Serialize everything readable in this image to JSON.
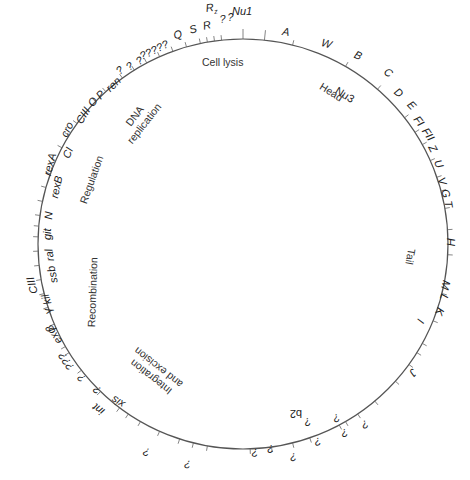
{
  "title": "",
  "circle": {
    "cx": 243,
    "cy": 244,
    "r": 205,
    "stroke": "#555555"
  },
  "ticks_deg": [
    -90,
    -84,
    -76,
    -60,
    -49,
    -38,
    -33,
    -29,
    -24,
    -19,
    -15,
    -10,
    -4,
    3,
    14,
    22,
    29,
    32,
    36,
    42,
    50,
    56,
    60,
    62,
    71,
    76,
    82,
    88,
    100,
    104,
    108,
    114,
    120,
    124,
    127,
    134,
    142,
    148,
    150,
    157,
    162,
    166,
    170,
    174,
    178,
    182,
    185,
    188,
    192,
    196,
    200,
    204,
    208,
    212,
    216,
    220,
    224,
    228,
    234,
    238,
    242,
    246,
    250,
    254,
    258,
    260,
    262,
    264
  ],
  "genes": [
    {
      "label": "Nu1",
      "x": 232,
      "y": 6,
      "rot": 0
    },
    {
      "label": "A",
      "x": 283,
      "y": 26,
      "rot": 8
    },
    {
      "label": "W",
      "x": 323,
      "y": 37,
      "rot": 16
    },
    {
      "label": "B",
      "x": 357,
      "y": 49,
      "rot": 24
    },
    {
      "label": "C",
      "x": 388,
      "y": 66,
      "rot": 34
    },
    {
      "label": "D",
      "x": 399,
      "y": 86,
      "rot": 40
    },
    {
      "label": "E",
      "x": 413,
      "y": 99,
      "rot": 46
    },
    {
      "label": "FI",
      "x": 420,
      "y": 114,
      "rot": 52
    },
    {
      "label": "FII",
      "x": 429,
      "y": 126,
      "rot": 56
    },
    {
      "label": "Z",
      "x": 436,
      "y": 143,
      "rot": 62
    },
    {
      "label": "U",
      "x": 442,
      "y": 158,
      "rot": 66
    },
    {
      "label": "V",
      "x": 446,
      "y": 176,
      "rot": 72
    },
    {
      "label": "G",
      "x": 450,
      "y": 188,
      "rot": 76
    },
    {
      "label": "T",
      "x": 453,
      "y": 200,
      "rot": 80
    },
    {
      "label": "H",
      "x": 456,
      "y": 238,
      "rot": 90
    },
    {
      "label": "M",
      "x": 452,
      "y": 282,
      "rot": 104
    },
    {
      "label": "L",
      "x": 450,
      "y": 296,
      "rot": 108
    },
    {
      "label": "K",
      "x": 446,
      "y": 310,
      "rot": 112
    },
    {
      "label": "I",
      "x": 426,
      "y": 322,
      "rot": 116
    },
    {
      "label": "J",
      "x": 419,
      "y": 374,
      "rot": 132
    },
    {
      "label": "?",
      "x": 370,
      "y": 428,
      "rot": 156
    },
    {
      "label": "?",
      "x": 349,
      "y": 437,
      "rot": 162
    },
    {
      "label": "?",
      "x": 341,
      "y": 422,
      "rot": 160
    },
    {
      "label": "?",
      "x": 322,
      "y": 446,
      "rot": 166
    },
    {
      "label": "?",
      "x": 312,
      "y": 426,
      "rot": 162
    },
    {
      "label": "?",
      "x": 297,
      "y": 462,
      "rot": 172
    },
    {
      "label": "?",
      "x": 274,
      "y": 454,
      "rot": 176
    },
    {
      "label": "?",
      "x": 258,
      "y": 458,
      "rot": 178
    },
    {
      "label": "?",
      "x": 190,
      "y": 470,
      "rot": 186
    },
    {
      "label": "?",
      "x": 148,
      "y": 458,
      "rot": 194
    },
    {
      "label": "xis",
      "x": 121,
      "y": 410,
      "rot": 212
    },
    {
      "label": "int",
      "x": 100,
      "y": 417,
      "rot": 216
    },
    {
      "label": "?",
      "x": 96,
      "y": 396,
      "rot": 220
    },
    {
      "label": "?",
      "x": 80,
      "y": 384,
      "rot": 224
    },
    {
      "label": "exo",
      "x": 55,
      "y": 346,
      "rot": 236
    },
    {
      "label": "???",
      "x": 67,
      "y": 372,
      "rot": 236
    },
    {
      "label": "β",
      "x": 47,
      "y": 334,
      "rot": 240
    },
    {
      "label": "γ",
      "x": 44,
      "y": 316,
      "rot": 246
    },
    {
      "label": "kil",
      "x": 43,
      "y": 306,
      "rot": 252
    },
    {
      "label": "CIII",
      "x": 29,
      "y": 295,
      "rot": 256
    },
    {
      "label": "ssb",
      "x": 49,
      "y": 284,
      "rot": 258
    },
    {
      "label": "ral",
      "x": 45,
      "y": 262,
      "rot": 262
    },
    {
      "label": "git",
      "x": 42,
      "y": 240,
      "rot": 270
    },
    {
      "label": "N",
      "x": 43,
      "y": 219,
      "rot": 274
    },
    {
      "label": "rexB",
      "x": 49,
      "y": 197,
      "rot": 282
    },
    {
      "label": "rexA",
      "x": 42,
      "y": 174,
      "rot": 284
    },
    {
      "label": "CI",
      "x": 61,
      "y": 156,
      "rot": 292
    },
    {
      "label": "cro",
      "x": 59,
      "y": 134,
      "rot": 296
    },
    {
      "label": "CIII",
      "x": 74,
      "y": 120,
      "rot": 302
    },
    {
      "label": "O",
      "x": 86,
      "y": 102,
      "rot": 308
    },
    {
      "label": "P",
      "x": 94,
      "y": 94,
      "rot": 312
    },
    {
      "label": "ren",
      "x": 104,
      "y": 86,
      "rot": 316
    },
    {
      "label": "?",
      "x": 114,
      "y": 68,
      "rot": 320
    },
    {
      "label": "?",
      "x": 124,
      "y": 64,
      "rot": 322
    },
    {
      "label": "?",
      "x": 134,
      "y": 58,
      "rot": 326
    },
    {
      "label": "?????",
      "x": 138,
      "y": 52,
      "rot": 334
    },
    {
      "label": "Q",
      "x": 172,
      "y": 31,
      "rot": 340
    },
    {
      "label": "S",
      "x": 188,
      "y": 25,
      "rot": 344
    },
    {
      "label": "R",
      "x": 202,
      "y": 21,
      "rot": 348
    },
    {
      "label": "Rz",
      "x": 205,
      "y": 3,
      "rot": 352
    },
    {
      "label": "?",
      "x": 219,
      "y": 14,
      "rot": 354
    },
    {
      "label": "?",
      "x": 227,
      "y": 12,
      "rot": 356
    }
  ],
  "inner_labels": [
    {
      "label": "Nu3",
      "x": 339,
      "y": 85,
      "rot": 32,
      "italic": false
    },
    {
      "label": "b2",
      "x": 302,
      "y": 419,
      "rot": 180,
      "italic": false
    }
  ],
  "regions": [
    {
      "name": "cell-lysis",
      "lines": [
        "Cell lysis"
      ],
      "x": 202,
      "y": 56,
      "rot": 0
    },
    {
      "name": "head",
      "lines": [
        "Head"
      ],
      "x": 324,
      "y": 80,
      "rot": 32
    },
    {
      "name": "tail",
      "lines": [
        "Tail"
      ],
      "x": 418,
      "y": 250,
      "rot": 100
    },
    {
      "name": "dna-replication",
      "lines": [
        "DNA",
        "replication"
      ],
      "x": 115,
      "y": 131,
      "rot": -52
    },
    {
      "name": "regulation",
      "lines": [
        "Regulation"
      ],
      "x": 77,
      "y": 201,
      "rot": -70
    },
    {
      "name": "recombination",
      "lines": [
        "Recombination"
      ],
      "x": 85,
      "y": 327,
      "rot": -88
    },
    {
      "name": "integration-excision",
      "lines": [
        "Integration",
        "and excision"
      ],
      "x": 170,
      "y": 400,
      "rot": 218
    }
  ]
}
